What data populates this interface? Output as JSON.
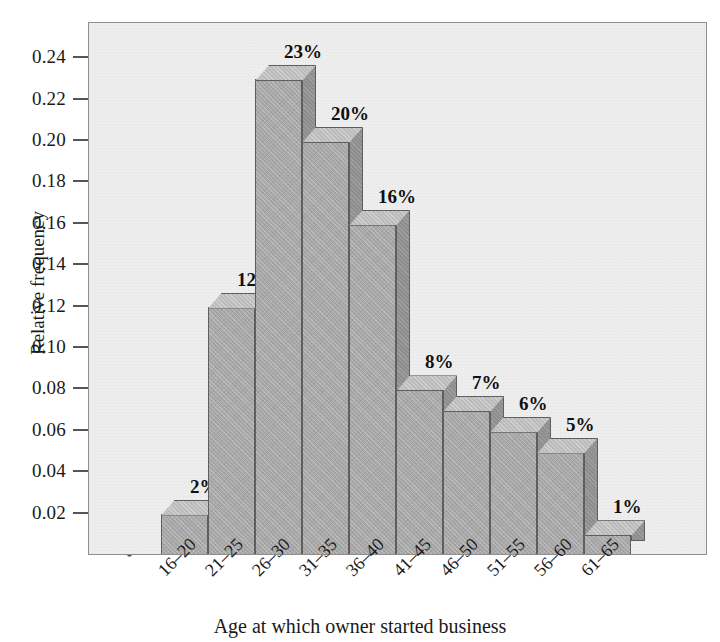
{
  "chart_data": {
    "type": "bar",
    "title": "",
    "subtitle": "",
    "xlabel": "Age at which owner started business",
    "ylabel": "Relative frequency",
    "categories": [
      "16–20",
      "21–25",
      "26–30",
      "31–35",
      "36–40",
      "41–45",
      "46–50",
      "51–55",
      "56–60",
      "61–65"
    ],
    "values": [
      0.02,
      0.12,
      0.23,
      0.2,
      0.16,
      0.08,
      0.07,
      0.06,
      0.05,
      0.01
    ],
    "data_labels": [
      "2%",
      "12%",
      "23%",
      "20%",
      "16%",
      "8%",
      "7%",
      "6%",
      "5%",
      "1%"
    ],
    "ylim": [
      0.0,
      0.2575
    ],
    "ytick_values": [
      0.02,
      0.04,
      0.06,
      0.08,
      0.1,
      0.12,
      0.14,
      0.16,
      0.18,
      0.2,
      0.22,
      0.24
    ],
    "ytick_labels": [
      "0.02",
      "0.04",
      "0.06",
      "0.08",
      "0.10",
      "0.12",
      "0.14",
      "0.16",
      "0.18",
      "0.20",
      "0.22",
      "0.24"
    ],
    "grid": false,
    "legend": null,
    "axis_break": "⸺",
    "axis_break_symbol": "≈",
    "style": "3d-bars",
    "colors": {
      "plot_background": "#eeeeee",
      "figure_background": "#ffffff",
      "bar_front": "#a9a9a9",
      "bar_top": "#bdbdbd",
      "bar_side": "#8f8f8f",
      "bar_edge": "#5f5f5f",
      "axis": "#8e8e8e",
      "text": "#1a1a1a"
    }
  },
  "axis": {
    "y_title": "Relative frequency",
    "x_title": "Age at which owner started business",
    "break_glyph": "≈"
  }
}
